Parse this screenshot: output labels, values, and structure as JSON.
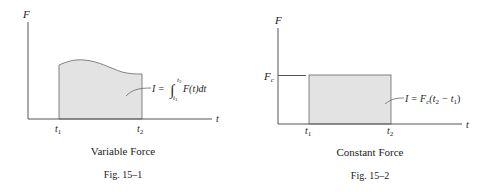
{
  "figures": [
    {
      "id": "fig-15-1",
      "y_axis_label": "F",
      "x_axis_label": "t",
      "tick_t1": "t",
      "tick_t1_sub": "1",
      "tick_t2": "t",
      "tick_t2_sub": "2",
      "formula": {
        "lhs": "I =",
        "integral": "∫",
        "upper": "t",
        "upper_sub": "2",
        "lower": "t",
        "lower_sub": "1",
        "integrand": "F(t)dt"
      },
      "title": "Variable Force",
      "caption": "Fig. 15–1"
    },
    {
      "id": "fig-15-2",
      "y_axis_label": "F",
      "x_axis_label": "t",
      "level_label": "F",
      "level_label_sub": "c",
      "tick_t1": "t",
      "tick_t1_sub": "1",
      "tick_t2": "t",
      "tick_t2_sub": "2",
      "formula": {
        "lhs": "I = F",
        "lhs_sub": "c",
        "open": "(t",
        "a_sub": "2",
        "minus": " − t",
        "b_sub": "1",
        "close": ")"
      },
      "title": "Constant Force",
      "caption": "Fig. 15–2"
    }
  ],
  "colors": {
    "fill": "#e3e3e3",
    "line": "#555555",
    "text": "#222222"
  }
}
